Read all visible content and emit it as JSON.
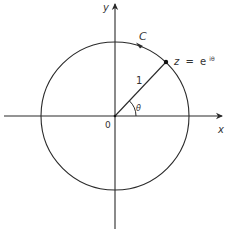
{
  "diagram": {
    "type": "unit-circle-complex-plane",
    "colors": {
      "stroke": "#2a2a2a",
      "text": "#333333",
      "background": "#ffffff"
    },
    "axes": {
      "x_label": "x",
      "y_label": "y",
      "origin_label": "0"
    },
    "circle": {
      "label": "C",
      "radius_label": "1"
    },
    "point": {
      "label_lhs": "z",
      "label_eq": "=",
      "label_base": "e",
      "label_exp": "iθ"
    },
    "angle": {
      "label": "θ"
    }
  }
}
